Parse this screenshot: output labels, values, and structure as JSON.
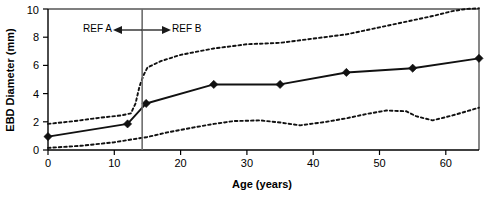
{
  "chart_data": {
    "type": "line",
    "title": "",
    "xlabel": "Age (years)",
    "ylabel": "EBD Diameter (mm)",
    "xlim": [
      0,
      65
    ],
    "ylim": [
      0,
      10
    ],
    "xticks": [
      0,
      10,
      20,
      30,
      40,
      50,
      60
    ],
    "xtick_labels": [
      "0",
      "10",
      "20",
      "30",
      "40",
      "50",
      "60"
    ],
    "yticks": [
      0,
      2,
      4,
      6,
      8,
      10
    ],
    "ytick_labels": [
      "0",
      "2",
      "4",
      "6",
      "8",
      "10"
    ],
    "grid": false,
    "legend": "none",
    "series": [
      {
        "name": "Mean EBD diameter",
        "style": "solid-with-diamond-markers",
        "markers": true,
        "x": [
          0,
          12,
          14.8,
          25,
          35,
          45,
          55,
          65
        ],
        "values": [
          0.95,
          1.85,
          3.3,
          4.65,
          4.65,
          5.5,
          5.8,
          6.5
        ]
      },
      {
        "name": "Upper bound",
        "style": "dotted",
        "markers": false,
        "x": [
          0,
          4,
          8,
          11,
          12.5,
          13.2,
          13.8,
          14.4,
          15,
          17,
          20,
          25,
          30,
          35,
          40,
          45,
          50,
          55,
          58,
          61,
          63,
          65
        ],
        "values": [
          1.85,
          2.05,
          2.3,
          2.45,
          2.6,
          3.3,
          4.5,
          5.3,
          5.85,
          6.3,
          6.75,
          7.2,
          7.5,
          7.6,
          7.9,
          8.2,
          8.7,
          9.2,
          9.5,
          9.85,
          10.0,
          10.05
        ]
      },
      {
        "name": "Lower bound",
        "style": "dotted",
        "markers": false,
        "x": [
          0,
          5,
          10,
          14,
          14.8,
          18,
          22,
          25,
          28,
          32,
          35,
          38,
          42,
          45,
          48,
          51,
          54,
          55.5,
          58,
          61,
          65
        ],
        "values": [
          0.15,
          0.3,
          0.55,
          0.85,
          0.9,
          1.25,
          1.6,
          1.85,
          2.05,
          2.1,
          1.95,
          1.75,
          2.0,
          2.25,
          2.55,
          2.8,
          2.75,
          2.4,
          2.1,
          2.45,
          3.0
        ]
      }
    ],
    "annotations": [
      {
        "name": "ref-a",
        "text": "REF A",
        "arrow_direction": "left",
        "x_at": 14.2
      },
      {
        "name": "ref-b",
        "text": "REF B",
        "arrow_direction": "right",
        "x_at": 14.2
      }
    ],
    "divider": {
      "name": "ref-divider",
      "x": 14.2,
      "color": "#6d6d6d"
    },
    "colors": {
      "line": "#111111",
      "band": "#111111",
      "frame": "#555555",
      "divider": "#6d6d6d",
      "background": "#ffffff"
    }
  }
}
